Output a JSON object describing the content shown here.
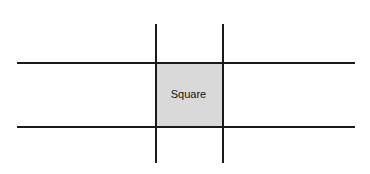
{
  "diagram": {
    "center_label": "Square",
    "fill_color": "#d9d9d9",
    "line_color": "#1a1a1a"
  }
}
